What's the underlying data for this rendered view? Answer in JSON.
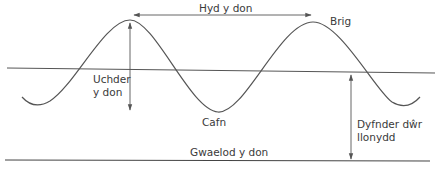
{
  "diagram": {
    "colors": {
      "line": "#555555",
      "text": "#3a3a3a",
      "background": "#ffffff"
    },
    "labels": {
      "wavelength": "Hyd y don",
      "crest": "Brig",
      "wave_height_line1": "Uchder",
      "wave_height_line2": "y don",
      "trough": "Cafn",
      "depth_line1": "Dyfnder dŵr",
      "depth_line2": "llonydd",
      "wave_base": "Gwaelod y don"
    }
  }
}
